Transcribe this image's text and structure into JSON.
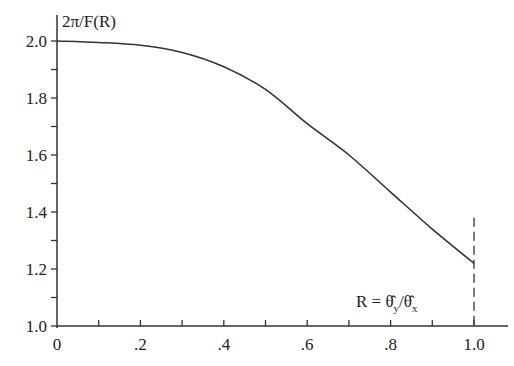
{
  "chart_data": {
    "type": "line",
    "title": "",
    "ylabel": "2π/F(R)",
    "xlabel": "R = θ̂y/θ̂x",
    "xlabel_parts": {
      "lhs": "R = ",
      "num": "θ",
      "num_sub": "y",
      "sep": "/",
      "den": "θ",
      "den_sub": "x"
    },
    "xlim": [
      0,
      1.0
    ],
    "ylim": [
      1.0,
      2.0
    ],
    "x_ticks_major": [
      0,
      0.2,
      0.4,
      0.6,
      0.8,
      1.0
    ],
    "x_tick_labels": [
      "0",
      ".2",
      ".4",
      ".6",
      ".8",
      "1.0"
    ],
    "x_ticks_minor": [
      0.1,
      0.3,
      0.5,
      0.7,
      0.9
    ],
    "y_ticks_major": [
      1.0,
      1.2,
      1.4,
      1.6,
      1.8,
      2.0
    ],
    "y_tick_labels": [
      "1.0",
      "1.2",
      "1.4",
      "1.6",
      "1.8",
      "2.0"
    ],
    "y_ticks_minor": [
      1.1,
      1.3,
      1.5,
      1.7,
      1.9
    ],
    "grid": false,
    "legend": null,
    "series": [
      {
        "name": "2π/F(R)",
        "x": [
          0,
          0.1,
          0.2,
          0.3,
          0.4,
          0.5,
          0.6,
          0.7,
          0.8,
          0.9,
          1.0
        ],
        "values": [
          2.0,
          1.995,
          1.985,
          1.96,
          1.91,
          1.83,
          1.71,
          1.6,
          1.47,
          1.34,
          1.22
        ],
        "color": "#333333"
      }
    ],
    "annotations": [
      {
        "type": "vertical-dashed-line",
        "x": 1.0,
        "y_from": 1.0,
        "y_to": 1.38
      }
    ]
  }
}
